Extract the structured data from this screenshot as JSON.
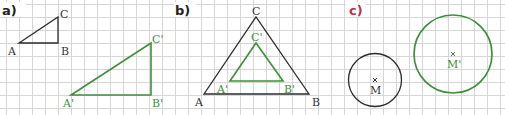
{
  "colors": {
    "grid": "#d4d4d4",
    "original": "#2b2b2b",
    "image": "#3f8f3a",
    "label_c": "#c0304a",
    "label_dark": "#222222"
  },
  "panels": {
    "a": {
      "label": "a)",
      "original_triangle": {
        "A": "A",
        "B": "B",
        "C": "C"
      },
      "image_triangle": {
        "A": "A'",
        "B": "B'",
        "C": "C'"
      }
    },
    "b": {
      "label": "b)",
      "original_triangle": {
        "A": "A",
        "B": "B",
        "C": "C"
      },
      "image_triangle": {
        "A": "A'",
        "B": "B'",
        "C": "C'"
      }
    },
    "c": {
      "label": "c)",
      "original_circle": {
        "center": "M"
      },
      "image_circle": {
        "center": "M'"
      }
    }
  }
}
